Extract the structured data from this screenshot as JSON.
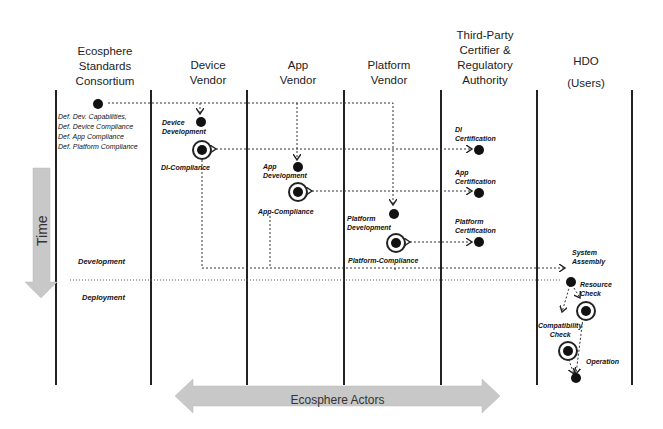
{
  "lanes": [
    {
      "id": "consortium",
      "header": [
        "Ecosphere",
        "Standards",
        "Consortium"
      ]
    },
    {
      "id": "device",
      "header": [
        "Device",
        "Vendor"
      ]
    },
    {
      "id": "app",
      "header": [
        "App",
        "Vendor"
      ]
    },
    {
      "id": "platform",
      "header": [
        "Platform",
        "Vendor"
      ]
    },
    {
      "id": "certifier",
      "header": [
        "Third-Party",
        "Certifier &",
        "Regulatory",
        "Authority"
      ]
    },
    {
      "id": "hdo",
      "header": [
        "HDO",
        "(Users)"
      ]
    }
  ],
  "consortium_defs": [
    "Def. Dev. Capabilities,",
    "Def. Device Compliance",
    "Def. App Compliance",
    "Def. Platform Compliance"
  ],
  "nodes": {
    "device_dev": [
      "Device",
      "Development"
    ],
    "di_compliance": "DI-Compliance",
    "app_dev": [
      "App",
      "Development"
    ],
    "app_compliance": "App-Compliance",
    "platform_dev": [
      "Platform",
      "Development"
    ],
    "platform_compliance": "Platform-Compliance",
    "di_cert": [
      "DI",
      "Certification"
    ],
    "app_cert": [
      "App",
      "Certification"
    ],
    "platform_cert": [
      "Platform",
      "Certification"
    ],
    "system_assembly": [
      "System",
      "Assembly"
    ],
    "resource_check": [
      "Resource",
      "Check"
    ],
    "compat_check": [
      "Compatibility",
      "Check"
    ],
    "operation": "Operation"
  },
  "phases": {
    "development": "Development",
    "deployment": "Deployment"
  },
  "axes": {
    "time": "Time",
    "actors": "Ecosphere Actors"
  },
  "colors": {
    "arrow_fill": "#c8c8c8",
    "line": "#222222"
  }
}
